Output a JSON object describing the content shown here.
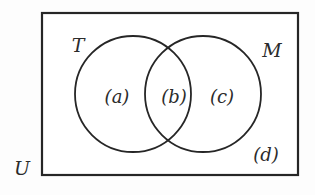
{
  "figure": {
    "kind": "venn-diagram",
    "stroke_color": "#262626",
    "fill_color": "#ffffff",
    "background_color": "#fdfdfd",
    "text_color": "#2b2b2b"
  },
  "universe": {
    "label": "U",
    "rect": {
      "x": 42,
      "y": 13,
      "width": 256,
      "height": 162
    }
  },
  "sets": [
    {
      "id": "T",
      "label": "T",
      "circle": {
        "cx": 133,
        "cy": 94,
        "r": 58
      }
    },
    {
      "id": "M",
      "label": "M",
      "circle": {
        "cx": 203,
        "cy": 94,
        "r": 58
      }
    }
  ],
  "regions": [
    {
      "id": "a",
      "label": "(a)",
      "meaning": "T only"
    },
    {
      "id": "b",
      "label": "(b)",
      "meaning": "T and M"
    },
    {
      "id": "c",
      "label": "(c)",
      "meaning": "M only"
    },
    {
      "id": "d",
      "label": "(d)",
      "meaning": "neither T nor M"
    }
  ]
}
